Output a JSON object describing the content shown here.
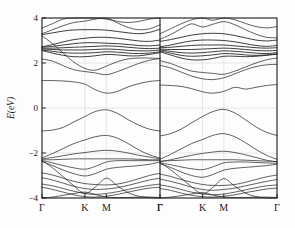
{
  "figure": {
    "title": "",
    "ylabel": "E(eV)",
    "xlabel": "",
    "background_color": "#fdfdfd",
    "line_color": "#2b2b2b",
    "grid_color": "#cfcfcf",
    "frame_color": "#1a1a1a"
  },
  "yticks": [
    {
      "value": 4,
      "label": "4"
    },
    {
      "value": 2,
      "label": "2"
    },
    {
      "value": 0,
      "label": "0"
    },
    {
      "value": -2,
      "label": "−2"
    },
    {
      "value": -4,
      "label": "−4"
    }
  ],
  "xticks": [
    {
      "label": "Γ",
      "pos": 0.0
    },
    {
      "label": "K",
      "pos": 0.3636
    },
    {
      "label": "M",
      "pos": 0.5454
    },
    {
      "label": "Γ",
      "pos": 1.0
    }
  ],
  "chart_data": {
    "type": "line",
    "title": "",
    "subtitle": "",
    "xlabel": "",
    "ylabel": "E(eV)",
    "ylim": [
      -4,
      4
    ],
    "grid": true,
    "legend": "none",
    "panel_count": 2,
    "x_tick_labels": [
      "Γ",
      "K",
      "M",
      "Γ"
    ],
    "x_tick_positions": [
      0.0,
      0.3636,
      0.5454,
      1.0
    ],
    "y_tick_values": [
      4,
      2,
      0,
      -2,
      -4
    ],
    "panels": [
      {
        "name": "left-panel",
        "label": "",
        "x_path": [
          "Γ",
          "K",
          "M",
          "Γ"
        ],
        "x_sample_positions": [
          0.0,
          0.09,
          0.18,
          0.27,
          0.3636,
          0.45,
          0.5454,
          0.64,
          0.73,
          0.82,
          0.91,
          1.0
        ],
        "series": [
          {
            "name": "c12",
            "values": [
              3.55,
              3.75,
              3.95,
              4.05,
              4.02,
              4.05,
              3.95,
              3.85,
              3.8,
              3.85,
              3.95,
              4.05
            ]
          },
          {
            "name": "c11",
            "values": [
              3.3,
              3.48,
              3.66,
              3.8,
              3.86,
              3.95,
              4.0,
              3.78,
              3.58,
              3.48,
              3.52,
              3.7
            ]
          },
          {
            "name": "c10",
            "values": [
              3.26,
              3.34,
              3.42,
              3.47,
              3.48,
              3.48,
              3.46,
              3.4,
              3.34,
              3.3,
              3.36,
              3.5
            ]
          },
          {
            "name": "c9",
            "values": [
              2.72,
              2.82,
              2.94,
              3.04,
              3.1,
              3.14,
              3.14,
              3.1,
              3.04,
              2.98,
              2.96,
              3.02
            ]
          },
          {
            "name": "c8",
            "values": [
              2.7,
              2.74,
              2.8,
              2.86,
              2.9,
              2.9,
              2.88,
              2.86,
              2.82,
              2.78,
              2.76,
              2.8
            ]
          },
          {
            "name": "c7",
            "values": [
              2.66,
              2.66,
              2.68,
              2.7,
              2.72,
              2.74,
              2.76,
              2.74,
              2.7,
              2.66,
              2.64,
              2.66
            ]
          },
          {
            "name": "c6",
            "values": [
              2.62,
              2.6,
              2.58,
              2.58,
              2.58,
              2.6,
              2.62,
              2.6,
              2.56,
              2.54,
              2.54,
              2.58
            ]
          },
          {
            "name": "c5",
            "values": [
              2.58,
              2.52,
              2.46,
              2.44,
              2.44,
              2.46,
              2.5,
              2.48,
              2.44,
              2.42,
              2.44,
              2.5
            ]
          },
          {
            "name": "c4",
            "values": [
              2.55,
              2.44,
              2.34,
              2.28,
              2.28,
              2.32,
              2.38,
              2.36,
              2.32,
              2.32,
              2.38,
              2.46
            ]
          },
          {
            "name": "c3",
            "values": [
              2.18,
              2.08,
              1.88,
              1.7,
              1.62,
              1.56,
              1.48,
              1.62,
              1.8,
              1.98,
              2.12,
              2.2
            ]
          },
          {
            "name": "c2",
            "values": [
              3.2,
              2.86,
              2.44,
              2.04,
              1.76,
              1.68,
              1.86,
              2.06,
              2.18,
              2.22,
              2.22,
              2.2
            ]
          },
          {
            "name": "c1",
            "values": [
              1.22,
              1.22,
              1.2,
              1.16,
              1.06,
              0.82,
              0.66,
              0.74,
              0.94,
              1.08,
              1.18,
              1.22
            ]
          },
          {
            "name": "v1",
            "values": [
              -1.02,
              -0.98,
              -0.86,
              -0.62,
              -0.38,
              -0.16,
              -0.08,
              -0.24,
              -0.52,
              -0.76,
              -0.94,
              -1.02
            ]
          },
          {
            "name": "v2",
            "values": [
              -2.22,
              -2.02,
              -1.8,
              -1.58,
              -1.42,
              -1.28,
              -1.22,
              -1.34,
              -1.58,
              -1.86,
              -2.08,
              -2.22
            ]
          },
          {
            "name": "v3",
            "values": [
              -2.26,
              -2.2,
              -2.12,
              -2.04,
              -1.98,
              -1.92,
              -1.88,
              -1.92,
              -2.0,
              -2.1,
              -2.18,
              -2.26
            ]
          },
          {
            "name": "v4",
            "values": [
              -2.3,
              -2.3,
              -2.28,
              -2.26,
              -2.26,
              -2.26,
              -2.26,
              -2.26,
              -2.26,
              -2.28,
              -2.3,
              -2.3
            ]
          },
          {
            "name": "v5",
            "values": [
              -2.34,
              -2.44,
              -2.56,
              -2.66,
              -2.72,
              -2.6,
              -2.4,
              -2.34,
              -2.34,
              -2.34,
              -2.34,
              -2.34
            ]
          },
          {
            "name": "v6",
            "values": [
              -2.38,
              -2.56,
              -2.76,
              -2.92,
              -3.02,
              -2.92,
              -2.72,
              -2.64,
              -2.6,
              -2.56,
              -2.5,
              -2.4
            ]
          },
          {
            "name": "v7",
            "values": [
              -2.88,
              -2.98,
              -3.12,
              -3.26,
              -3.36,
              -3.4,
              -3.42,
              -3.38,
              -3.28,
              -3.14,
              -3.0,
              -2.9
            ]
          },
          {
            "name": "v8",
            "values": [
              -3.1,
              -3.2,
              -3.34,
              -3.48,
              -3.58,
              -3.62,
              -3.6,
              -3.54,
              -3.44,
              -3.32,
              -3.2,
              -3.12
            ]
          },
          {
            "name": "v9",
            "values": [
              -3.38,
              -3.46,
              -3.58,
              -3.7,
              -3.8,
              -3.84,
              -3.8,
              -3.72,
              -3.62,
              -3.52,
              -3.44,
              -3.38
            ]
          },
          {
            "name": "v10",
            "values": [
              -3.52,
              -3.62,
              -3.74,
              -3.86,
              -3.94,
              -3.96,
              -3.92,
              -3.84,
              -3.74,
              -3.64,
              -3.56,
              -3.52
            ]
          },
          {
            "name": "v11",
            "values": [
              -2.34,
              -2.66,
              -3.06,
              -3.46,
              -3.8,
              -3.52,
              -3.12,
              -3.46,
              -3.76,
              -3.92,
              -3.98,
              -4.0
            ]
          },
          {
            "name": "v12",
            "values": [
              -4.0,
              -3.96,
              -3.88,
              -3.8,
              -3.74,
              -3.84,
              -3.96,
              -3.98,
              -3.98,
              -3.96,
              -3.96,
              -3.98
            ]
          }
        ]
      },
      {
        "name": "right-panel",
        "label": "",
        "x_path": [
          "Γ",
          "K",
          "M",
          "Γ"
        ],
        "x_sample_positions": [
          0.0,
          0.09,
          0.18,
          0.27,
          0.3636,
          0.45,
          0.5454,
          0.64,
          0.73,
          0.82,
          0.91,
          1.0
        ],
        "series": [
          {
            "name": "c12",
            "values": [
              3.3,
              3.52,
              3.74,
              3.92,
              4.0,
              3.9,
              4.02,
              3.92,
              3.76,
              3.62,
              3.56,
              3.62
            ]
          },
          {
            "name": "c11",
            "values": [
              3.06,
              3.26,
              3.52,
              3.74,
              3.6,
              3.72,
              3.84,
              3.7,
              3.48,
              3.28,
              3.14,
              3.12
            ]
          },
          {
            "name": "c10",
            "values": [
              2.96,
              3.04,
              3.14,
              3.24,
              3.3,
              3.32,
              3.3,
              3.22,
              3.12,
              3.02,
              2.98,
              3.02
            ]
          },
          {
            "name": "c9",
            "values": [
              2.72,
              2.8,
              2.9,
              2.98,
              3.02,
              3.02,
              3.0,
              2.94,
              2.86,
              2.78,
              2.74,
              2.78
            ]
          },
          {
            "name": "c8",
            "values": [
              2.68,
              2.7,
              2.74,
              2.78,
              2.8,
              2.8,
              2.8,
              2.76,
              2.72,
              2.68,
              2.66,
              2.68
            ]
          },
          {
            "name": "c7",
            "values": [
              2.62,
              2.6,
              2.6,
              2.6,
              2.62,
              2.64,
              2.66,
              2.64,
              2.6,
              2.56,
              2.54,
              2.56
            ]
          },
          {
            "name": "c6",
            "values": [
              2.58,
              2.52,
              2.46,
              2.44,
              2.46,
              2.5,
              2.54,
              2.52,
              2.48,
              2.44,
              2.42,
              2.46
            ]
          },
          {
            "name": "c5",
            "values": [
              2.54,
              2.44,
              2.34,
              2.3,
              2.32,
              2.36,
              2.42,
              2.4,
              2.36,
              2.34,
              2.36,
              2.4
            ]
          },
          {
            "name": "c4",
            "values": [
              2.5,
              2.36,
              2.22,
              2.14,
              2.14,
              2.2,
              2.3,
              2.3,
              2.28,
              2.3,
              2.34,
              2.4
            ]
          },
          {
            "name": "c3",
            "values": [
              2.1,
              1.98,
              1.8,
              1.64,
              1.58,
              1.54,
              1.5,
              1.64,
              1.82,
              2.0,
              2.14,
              2.22
            ]
          },
          {
            "name": "c2",
            "values": [
              1.9,
              1.78,
              1.6,
              1.42,
              1.3,
              1.26,
              1.34,
              1.52,
              1.7,
              1.84,
              1.92,
              1.94
            ]
          },
          {
            "name": "c1",
            "values": [
              1.02,
              1.0,
              0.96,
              0.86,
              0.72,
              0.66,
              0.74,
              0.92,
              0.84,
              0.92,
              1.0,
              1.04
            ]
          },
          {
            "name": "v1",
            "values": [
              -1.24,
              -1.14,
              -0.94,
              -0.66,
              -0.38,
              -0.16,
              -0.06,
              -0.22,
              -0.52,
              -0.84,
              -1.08,
              -1.22
            ]
          },
          {
            "name": "v2",
            "values": [
              -2.28,
              -2.06,
              -1.82,
              -1.58,
              -1.4,
              -1.22,
              -1.14,
              -1.28,
              -1.54,
              -1.84,
              -2.1,
              -2.28
            ]
          },
          {
            "name": "v3",
            "values": [
              -2.4,
              -2.3,
              -2.2,
              -2.1,
              -2.02,
              -1.96,
              -1.92,
              -1.98,
              -2.08,
              -2.2,
              -2.32,
              -2.4
            ]
          },
          {
            "name": "v4",
            "values": [
              -2.36,
              -2.34,
              -2.32,
              -2.3,
              -2.3,
              -2.3,
              -2.3,
              -2.3,
              -2.32,
              -2.34,
              -2.36,
              -2.38
            ]
          },
          {
            "name": "v5",
            "values": [
              -2.44,
              -2.52,
              -2.62,
              -2.7,
              -2.74,
              -2.62,
              -2.44,
              -2.4,
              -2.4,
              -2.42,
              -2.44,
              -2.46
            ]
          },
          {
            "name": "v6",
            "values": [
              -2.48,
              -2.64,
              -2.84,
              -3.0,
              -3.08,
              -2.96,
              -2.76,
              -2.68,
              -2.64,
              -2.6,
              -2.56,
              -2.5
            ]
          },
          {
            "name": "v7",
            "values": [
              -2.94,
              -3.04,
              -3.18,
              -3.3,
              -3.4,
              -3.44,
              -3.44,
              -3.4,
              -3.3,
              -3.18,
              -3.06,
              -2.98
            ]
          },
          {
            "name": "v8",
            "values": [
              -3.16,
              -3.26,
              -3.38,
              -3.52,
              -3.62,
              -3.66,
              -3.62,
              -3.56,
              -3.46,
              -3.36,
              -3.26,
              -3.18
            ]
          },
          {
            "name": "v9",
            "values": [
              -3.42,
              -3.5,
              -3.62,
              -3.74,
              -3.82,
              -3.86,
              -3.82,
              -3.74,
              -3.64,
              -3.54,
              -3.46,
              -3.42
            ]
          },
          {
            "name": "v10",
            "values": [
              -3.58,
              -3.66,
              -3.78,
              -3.88,
              -3.94,
              -3.96,
              -3.92,
              -3.86,
              -3.76,
              -3.68,
              -3.6,
              -3.56
            ]
          },
          {
            "name": "v11",
            "values": [
              -2.42,
              -2.74,
              -3.12,
              -3.5,
              -3.82,
              -3.54,
              -3.14,
              -3.48,
              -3.78,
              -3.94,
              -4.0,
              -4.0
            ]
          },
          {
            "name": "v12",
            "values": [
              -4.0,
              -3.96,
              -3.9,
              -3.82,
              -3.76,
              -3.86,
              -3.96,
              -3.98,
              -3.98,
              -3.96,
              -3.96,
              -3.98
            ]
          }
        ]
      }
    ]
  }
}
